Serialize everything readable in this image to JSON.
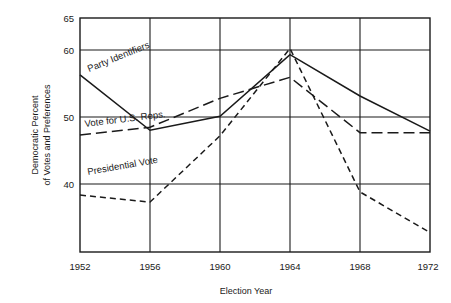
{
  "chart_data": {
    "type": "line",
    "title": "",
    "xlabel": "Election Year",
    "ylabel": "Democratic Percent of Votes and Preferences",
    "ylabel_line1": "Democratic Percent",
    "ylabel_line2": "of Votes and Preferences",
    "categories": [
      1952,
      1956,
      1960,
      1964,
      1968,
      1972
    ],
    "x_tick_labels": [
      "1952",
      "1956",
      "1960",
      "1964",
      "1968",
      "1972"
    ],
    "y_tick_labels": [
      "40",
      "50",
      "60",
      "65"
    ],
    "y_ticks": [
      40,
      50,
      60,
      65
    ],
    "xlim": [
      1952,
      1972
    ],
    "ylim": [
      35.0,
      65.0
    ],
    "grid": true,
    "grid_y_values": [
      40,
      50,
      60,
      65
    ],
    "grid_x_values": [
      1952,
      1956,
      1960,
      1964,
      1968,
      1972
    ],
    "legend_position": "inline-annotations",
    "series": [
      {
        "name": "Party Identifiers",
        "style": "solid",
        "label_text": "Party Identifiers",
        "values": [
          57.7,
          50.6,
          52.4,
          60.3,
          55.0,
          50.5
        ]
      },
      {
        "name": "Vote for U.S. Reps.",
        "style": "long-dash",
        "label_text": "Vote for U.S. Reps.",
        "values": [
          50.0,
          51.0,
          54.7,
          57.4,
          50.3,
          50.3
        ]
      },
      {
        "name": "Presidential Vote",
        "style": "short-dash",
        "label_text": "Presidential Vote",
        "values": [
          42.3,
          41.4,
          49.9,
          61.1,
          42.7,
          37.5
        ]
      }
    ],
    "annotations": [
      {
        "text": "Party Identifiers",
        "rotation": -22
      },
      {
        "text": "Vote for U.S. Reps.",
        "rotation": -8
      },
      {
        "text": "Presidential Vote",
        "rotation": -10
      }
    ],
    "colors": {
      "ink": "#1a1a1a",
      "background": "#ffffff"
    }
  }
}
